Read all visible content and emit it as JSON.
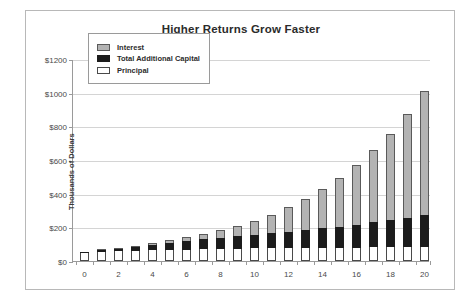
{
  "chart_data": {
    "type": "bar",
    "stacked": true,
    "title": "Higher Returns Grow Faster",
    "xlabel": "",
    "ylabel": "Thousands of Dollars",
    "ylim": [
      0,
      1200
    ],
    "ytick_values": [
      0,
      200,
      400,
      600,
      800,
      1000,
      1200
    ],
    "ytick_labels": [
      "$0",
      "$200",
      "$400",
      "$600",
      "$800",
      "$1000",
      "$1200"
    ],
    "xlim": [
      0,
      20
    ],
    "categories": [
      0,
      1,
      2,
      3,
      4,
      5,
      6,
      7,
      8,
      9,
      10,
      11,
      12,
      13,
      14,
      15,
      16,
      17,
      18,
      19,
      20
    ],
    "xtick_labels": [
      "0",
      "",
      "2",
      "",
      "4",
      "",
      "6",
      "",
      "8",
      "",
      "10",
      "",
      "12",
      "",
      "14",
      "",
      "16",
      "",
      "18",
      "",
      "20"
    ],
    "grid": "horizontal",
    "legend_position": "upper left",
    "series": [
      {
        "name": "Principal",
        "color": "#ffffff",
        "values": [
          50,
          55,
          58,
          62,
          64,
          66,
          68,
          70,
          72,
          74,
          75,
          76,
          77,
          78,
          79,
          80,
          80,
          81,
          82,
          83,
          83
        ]
      },
      {
        "name": "Total Additional Capital",
        "color": "#1c1c1c",
        "values": [
          5,
          8,
          14,
          22,
          30,
          40,
          48,
          58,
          66,
          75,
          82,
          90,
          98,
          105,
          116,
          124,
          136,
          148,
          160,
          172,
          188
        ]
      },
      {
        "name": "Interest",
        "color": "#b3b3b3",
        "values": [
          0,
          2,
          5,
          8,
          12,
          18,
          25,
          35,
          44,
          60,
          80,
          110,
          145,
          188,
          235,
          290,
          355,
          430,
          515,
          620,
          740
        ]
      }
    ],
    "totals": [
      55,
      65,
      77,
      92,
      106,
      124,
      141,
      163,
      182,
      209,
      237,
      276,
      320,
      371,
      430,
      494,
      571,
      659,
      757,
      875,
      1011
    ]
  }
}
